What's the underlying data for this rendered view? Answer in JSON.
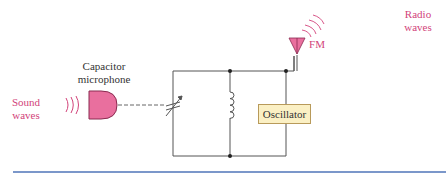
{
  "labels": {
    "sound_waves": [
      "Sound",
      "waves"
    ],
    "microphone": [
      "Capacitor",
      "microphone"
    ],
    "radio_waves": [
      "Radio",
      "waves"
    ],
    "fm": "FM",
    "oscillator": "Oscillator"
  },
  "colors": {
    "accent_pink": "#d2437a",
    "mic_fill": "#e96f9e",
    "oscillator_fill": "#fbf0c4",
    "wire": "#555555",
    "rule_blue": "#4f74b8"
  }
}
